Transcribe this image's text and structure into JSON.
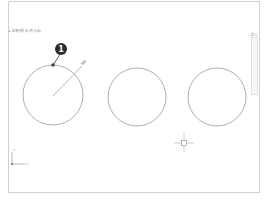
{
  "app": {
    "command_prompt": "▸ 命令行提示 (中心点)",
    "viewport_controls": "— 前 X"
  },
  "drawing": {
    "circles": [
      {
        "id": "left",
        "cx": 53,
        "cy": 95,
        "r": 30
      },
      {
        "id": "middle",
        "cx": 137,
        "cy": 97,
        "r": 29
      },
      {
        "id": "right",
        "cx": 217,
        "cy": 97,
        "r": 29
      }
    ],
    "radius_label": "半径",
    "callout_number": "1",
    "ucs": {
      "x_label": "X",
      "y_label": "Y"
    }
  },
  "colors": {
    "circle_stroke": "#9a9a9a",
    "callout_fill": "#2b2b2b",
    "frame_border": "#d0d0d0"
  }
}
